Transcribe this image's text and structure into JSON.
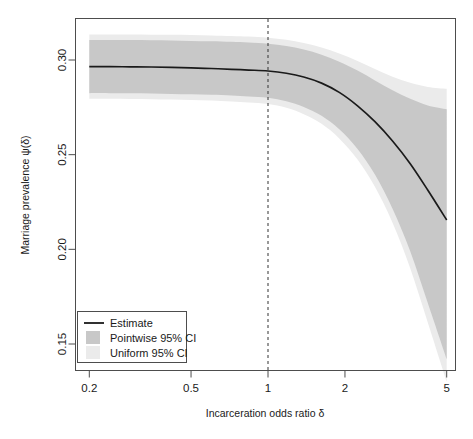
{
  "chart_data": {
    "type": "line",
    "title": "",
    "xlabel": "Incarceration odds ratio δ",
    "ylabel": "Marriage prevalence ψ(δ)",
    "xscale": "log",
    "yscale": "linear",
    "xlim": [
      0.2,
      5
    ],
    "ylim": [
      0.1435,
      0.3175
    ],
    "grid": false,
    "xticks": [
      0.2,
      0.5,
      1,
      2,
      5
    ],
    "xtick_labels": [
      "0.2",
      "0.5",
      "1",
      "2",
      "5"
    ],
    "yticks": [
      0.3,
      0.25,
      0.2,
      0.15
    ],
    "ytick_labels": [
      "0.30",
      "0.25",
      "0.20",
      "0.15"
    ],
    "legend_position": "lower-left",
    "annotations": [
      {
        "name": "reference-line",
        "type": "vline",
        "x": 1,
        "style": "dashed"
      }
    ],
    "colors": {
      "estimate": "#1a1a1a",
      "pointwise_ci": "#c8c8c8",
      "uniform_ci": "#ebebeb",
      "axis": "#4d4d4d",
      "background": "#ffffff"
    },
    "x": [
      0.2,
      0.24,
      0.29,
      0.35,
      0.42,
      0.5,
      0.6,
      0.72,
      0.84,
      1.0,
      1.18,
      1.38,
      1.62,
      1.9,
      2.24,
      2.62,
      3.07,
      3.6,
      4.22,
      5.0
    ],
    "series": [
      {
        "name": "Estimate",
        "values": [
          0.2965,
          0.2965,
          0.2964,
          0.2963,
          0.2961,
          0.2958,
          0.2955,
          0.2951,
          0.2947,
          0.2942,
          0.293,
          0.291,
          0.2878,
          0.2829,
          0.2758,
          0.2674,
          0.2572,
          0.2452,
          0.2312,
          0.2155
        ]
      },
      {
        "name": "Pointwise 95% CI",
        "kind": "band",
        "lower": [
          0.2825,
          0.2825,
          0.2824,
          0.2823,
          0.2821,
          0.2819,
          0.2816,
          0.2812,
          0.2807,
          0.28,
          0.2782,
          0.2752,
          0.2705,
          0.2634,
          0.253,
          0.2395,
          0.2215,
          0.199,
          0.1715,
          0.142
        ],
        "upper": [
          0.3105,
          0.3105,
          0.3105,
          0.3104,
          0.3103,
          0.3101,
          0.3099,
          0.3096,
          0.3092,
          0.3086,
          0.3074,
          0.3055,
          0.3028,
          0.2991,
          0.2944,
          0.2892,
          0.284,
          0.2795,
          0.276,
          0.274
        ]
      },
      {
        "name": "Uniform 95% CI",
        "kind": "band",
        "lower": [
          0.2795,
          0.2795,
          0.2794,
          0.2793,
          0.2791,
          0.2789,
          0.2786,
          0.2781,
          0.2776,
          0.2768,
          0.2748,
          0.2714,
          0.2663,
          0.2586,
          0.2474,
          0.233,
          0.214,
          0.19,
          0.1612,
          0.13
        ],
        "upper": [
          0.3135,
          0.3135,
          0.3135,
          0.3134,
          0.3133,
          0.3132,
          0.313,
          0.3127,
          0.3124,
          0.3118,
          0.3107,
          0.309,
          0.3066,
          0.3034,
          0.2995,
          0.2952,
          0.2912,
          0.288,
          0.2858,
          0.2848
        ]
      }
    ]
  },
  "legend": {
    "items": [
      {
        "label": "Estimate",
        "marker": "line",
        "color": "#1a1a1a"
      },
      {
        "label": "Pointwise 95% CI",
        "marker": "swatch",
        "color": "#c8c8c8"
      },
      {
        "label": "Uniform 95% CI",
        "marker": "swatch",
        "color": "#ebebeb"
      }
    ]
  },
  "axis": {
    "x_title": "Incarceration odds ratio δ",
    "y_title": "Marriage prevalence ψ(δ)",
    "x_tick_labels": [
      "0.2",
      "0.5",
      "1",
      "2",
      "5"
    ],
    "y_tick_labels": [
      "0.30",
      "0.25",
      "0.20",
      "0.15"
    ]
  }
}
